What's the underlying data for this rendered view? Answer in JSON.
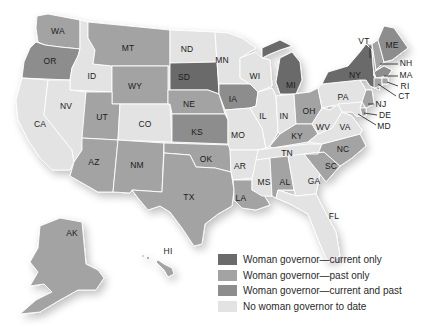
{
  "colors": {
    "current_only": "#6b6b6b",
    "past_only": "#a3a3a3",
    "current_and_past": "#8d8d8d",
    "none": "#e3e3e3"
  },
  "legend": [
    {
      "key": "current_only",
      "label": "Woman governor—current only"
    },
    {
      "key": "past_only",
      "label": "Woman governor—past only"
    },
    {
      "key": "current_and_past",
      "label": "Woman governor—current and past"
    },
    {
      "key": "none",
      "label": "No woman governor to date"
    }
  ],
  "states": {
    "WA": {
      "label": "WA",
      "category": "past_only"
    },
    "OR": {
      "label": "OR",
      "category": "current_and_past"
    },
    "CA": {
      "label": "CA",
      "category": "none"
    },
    "ID": {
      "label": "ID",
      "category": "none"
    },
    "NV": {
      "label": "NV",
      "category": "none"
    },
    "MT": {
      "label": "MT",
      "category": "past_only"
    },
    "WY": {
      "label": "WY",
      "category": "past_only"
    },
    "UT": {
      "label": "UT",
      "category": "past_only"
    },
    "AZ": {
      "label": "AZ",
      "category": "past_only"
    },
    "CO": {
      "label": "CO",
      "category": "none"
    },
    "NM": {
      "label": "NM",
      "category": "past_only"
    },
    "ND": {
      "label": "ND",
      "category": "none"
    },
    "SD": {
      "label": "SD",
      "category": "current_only"
    },
    "NE": {
      "label": "NE",
      "category": "past_only"
    },
    "KS": {
      "label": "KS",
      "category": "current_and_past"
    },
    "OK": {
      "label": "OK",
      "category": "past_only"
    },
    "TX": {
      "label": "TX",
      "category": "past_only"
    },
    "MN": {
      "label": "MN",
      "category": "none"
    },
    "IA": {
      "label": "IA",
      "category": "current_and_past"
    },
    "MO": {
      "label": "MO",
      "category": "none"
    },
    "AR": {
      "label": "AR",
      "category": "none"
    },
    "LA": {
      "label": "LA",
      "category": "past_only"
    },
    "WI": {
      "label": "WI",
      "category": "none"
    },
    "IL": {
      "label": "IL",
      "category": "none"
    },
    "MI": {
      "label": "MI",
      "category": "current_only"
    },
    "IN": {
      "label": "IN",
      "category": "none"
    },
    "OH": {
      "label": "OH",
      "category": "past_only"
    },
    "KY": {
      "label": "KY",
      "category": "past_only"
    },
    "TN": {
      "label": "TN",
      "category": "none"
    },
    "MS": {
      "label": "MS",
      "category": "none"
    },
    "AL": {
      "label": "AL",
      "category": "past_only"
    },
    "GA": {
      "label": "GA",
      "category": "none"
    },
    "FL": {
      "label": "FL",
      "category": "none"
    },
    "SC": {
      "label": "SC",
      "category": "past_only"
    },
    "NC": {
      "label": "NC",
      "category": "past_only"
    },
    "VA": {
      "label": "VA",
      "category": "none"
    },
    "WV": {
      "label": "WV",
      "category": "none"
    },
    "PA": {
      "label": "PA",
      "category": "none"
    },
    "NY": {
      "label": "NY",
      "category": "current_only"
    },
    "VT": {
      "label": "VT",
      "category": "past_only"
    },
    "NH": {
      "label": "NH",
      "category": "past_only"
    },
    "ME": {
      "label": "ME",
      "category": "current_and_past"
    },
    "MA": {
      "label": "MA",
      "category": "current_and_past"
    },
    "RI": {
      "label": "RI",
      "category": "past_only"
    },
    "CT": {
      "label": "CT",
      "category": "past_only"
    },
    "NJ": {
      "label": "NJ",
      "category": "past_only"
    },
    "DE": {
      "label": "DE",
      "category": "past_only"
    },
    "MD": {
      "label": "MD",
      "category": "none"
    },
    "AK": {
      "label": "AK",
      "category": "past_only"
    },
    "HI": {
      "label": "HI",
      "category": "past_only"
    }
  }
}
